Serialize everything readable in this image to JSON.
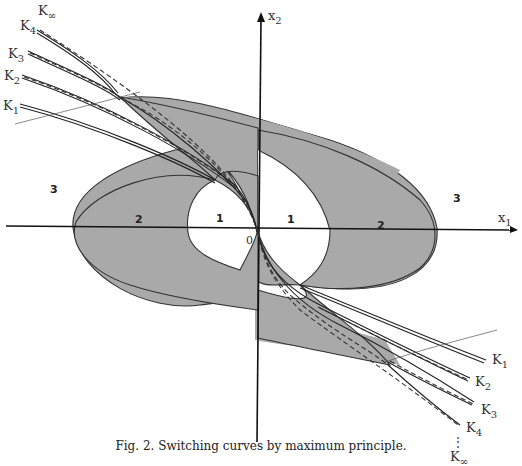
{
  "figure": {
    "caption": "Fig. 2.  Switching curves by maximum principle.",
    "axes": {
      "x_label": "x",
      "x_sub": "1",
      "y_label": "x",
      "y_sub": "2",
      "origin_label": "0"
    },
    "regions": [
      {
        "id": "left-3",
        "label": "3"
      },
      {
        "id": "left-2",
        "label": "2"
      },
      {
        "id": "left-1",
        "label": "1"
      },
      {
        "id": "right-1",
        "label": "1"
      },
      {
        "id": "right-2",
        "label": "2"
      },
      {
        "id": "right-3",
        "label": "3"
      }
    ],
    "curve_labels_upper_left": [
      {
        "label": "K",
        "sub": "∞"
      },
      {
        "label": "K",
        "sub": "4"
      },
      {
        "label": "K",
        "sub": "3"
      },
      {
        "label": "K",
        "sub": "2"
      },
      {
        "label": "K",
        "sub": "1"
      }
    ],
    "curve_labels_lower_right": [
      {
        "label": "K",
        "sub": "1"
      },
      {
        "label": "K",
        "sub": "2"
      },
      {
        "label": "K",
        "sub": "3"
      },
      {
        "label": "K",
        "sub": "4"
      },
      {
        "label": "K",
        "sub": "∞"
      }
    ],
    "ellipsis": "⋮",
    "colors": {
      "shaded_region": "#a9a9a9",
      "lines": "#222222"
    }
  }
}
